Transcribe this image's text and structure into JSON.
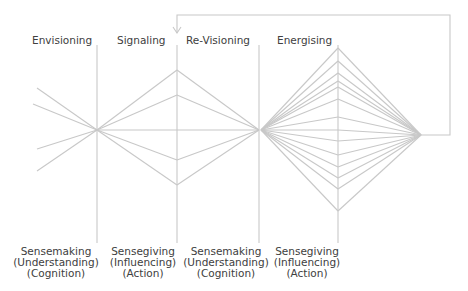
{
  "phases": [
    {
      "label": "Envisioning",
      "x": 32
    },
    {
      "label": "Signaling",
      "x": 117
    },
    {
      "label": "Re-Visioning",
      "x": 186
    },
    {
      "label": "Energising",
      "x": 277
    }
  ],
  "modes": [
    {
      "lines": [
        "Sensemaking",
        "(Understanding)",
        "(Cognition)"
      ],
      "cx": 56
    },
    {
      "lines": [
        "Sensegiving",
        "(Influencing)",
        "(Action)"
      ],
      "cx": 143
    },
    {
      "lines": [
        "Sensemaking",
        "(Understanding)",
        "(Cognition)"
      ],
      "cx": 226
    },
    {
      "lines": [
        "Sensegiving",
        "(Influencing)",
        "(Action)"
      ],
      "cx": 307
    }
  ],
  "colors": {
    "line": "#c8c8c8",
    "text": "#404040"
  },
  "geometry": {
    "verticals": [
      97,
      177,
      259,
      338
    ],
    "left_fan": {
      "apex": [
        97,
        130
      ],
      "ends": [
        [
          37,
          88
        ],
        [
          33,
          104
        ],
        [
          37,
          149
        ],
        [
          37,
          171
        ]
      ]
    },
    "diamond1": {
      "left": [
        97,
        130
      ],
      "right": [
        259,
        130
      ],
      "cx": 177,
      "ys": [
        70,
        95,
        130,
        160,
        185
      ]
    },
    "diamond2": {
      "left": [
        261,
        130
      ],
      "right": [
        421,
        135
      ],
      "cx": 338,
      "ys": [
        48,
        61,
        73,
        81,
        87,
        99,
        117,
        130,
        141,
        155,
        167,
        178,
        189,
        211
      ]
    },
    "feedback": {
      "points": [
        [
          421,
          135
        ],
        [
          450,
          135
        ],
        [
          450,
          15
        ],
        [
          177,
          15
        ],
        [
          177,
          33
        ]
      ]
    }
  }
}
